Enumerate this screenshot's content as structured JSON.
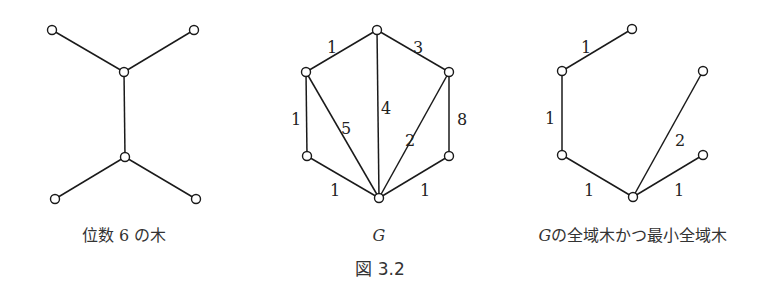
{
  "figure_label": "図 3.2",
  "panels": [
    {
      "id": "tree-degree-6",
      "caption": "位数 6 の木",
      "nodes": [
        "a",
        "b",
        "c",
        "d",
        "e",
        "f"
      ],
      "edges": [
        {
          "from": "a",
          "to": "c",
          "weight": ""
        },
        {
          "from": "b",
          "to": "c",
          "weight": ""
        },
        {
          "from": "c",
          "to": "d",
          "weight": ""
        },
        {
          "from": "d",
          "to": "e",
          "weight": ""
        },
        {
          "from": "d",
          "to": "f",
          "weight": ""
        }
      ]
    },
    {
      "id": "graph-G",
      "caption": "G",
      "nodes": [
        "top",
        "upper-left",
        "upper-right",
        "lower-left",
        "lower-right",
        "bottom"
      ],
      "edges": [
        {
          "from": "upper-left",
          "to": "top",
          "weight": "1"
        },
        {
          "from": "top",
          "to": "upper-right",
          "weight": "3"
        },
        {
          "from": "upper-left",
          "to": "lower-left",
          "weight": "1"
        },
        {
          "from": "upper-left",
          "to": "bottom",
          "weight": "5"
        },
        {
          "from": "top",
          "to": "bottom",
          "weight": "4"
        },
        {
          "from": "upper-right",
          "to": "bottom",
          "weight": "2"
        },
        {
          "from": "upper-right",
          "to": "lower-right",
          "weight": "8"
        },
        {
          "from": "lower-left",
          "to": "bottom",
          "weight": "1"
        },
        {
          "from": "lower-right",
          "to": "bottom",
          "weight": "1"
        }
      ]
    },
    {
      "id": "mst-of-G",
      "caption": "Gの全域木かつ最小全域木",
      "caption_italic_prefix": "G",
      "caption_rest": "の全域木かつ最小全域木",
      "nodes": [
        "top",
        "upper-left",
        "upper-right",
        "lower-left",
        "lower-right",
        "bottom"
      ],
      "edges": [
        {
          "from": "upper-left",
          "to": "top",
          "weight": "1"
        },
        {
          "from": "upper-left",
          "to": "lower-left",
          "weight": "1"
        },
        {
          "from": "lower-left",
          "to": "bottom",
          "weight": "1"
        },
        {
          "from": "upper-right",
          "to": "bottom",
          "weight": "2"
        },
        {
          "from": "lower-right",
          "to": "bottom",
          "weight": "1"
        }
      ]
    }
  ]
}
